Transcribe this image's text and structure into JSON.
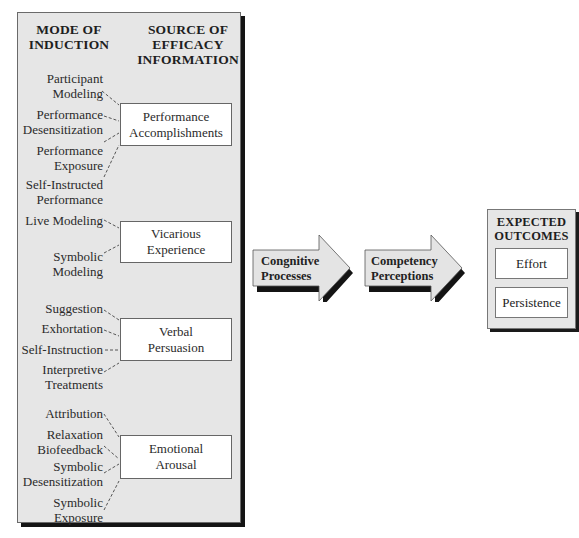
{
  "headers": {
    "mode_of_induction": [
      "MODE OF",
      "INDUCTION"
    ],
    "source_of_efficacy": [
      "SOURCE OF",
      "EFFICACY",
      "INFORMATION"
    ]
  },
  "sources": [
    {
      "label": [
        "Performance",
        "Accomplishments"
      ],
      "modes": [
        [
          "Participant",
          "Modeling"
        ],
        [
          "Performance",
          "Desensitization"
        ],
        [
          "Performance",
          "Exposure"
        ],
        [
          "Self-Instructed",
          "Performance"
        ]
      ]
    },
    {
      "label": [
        "Vicarious",
        "Experience"
      ],
      "modes": [
        [
          "Live Modeling"
        ],
        [
          "Symbolic",
          "Modeling"
        ]
      ]
    },
    {
      "label": [
        "Verbal",
        "Persuasion"
      ],
      "modes": [
        [
          "Suggestion"
        ],
        [
          "Exhortation"
        ],
        [
          "Self-Instruction"
        ],
        [
          "Interpretive",
          "Treatments"
        ]
      ]
    },
    {
      "label": [
        "Emotional",
        "Arousal"
      ],
      "modes": [
        [
          "Attribution"
        ],
        [
          "Relaxation",
          "Biofeedback"
        ],
        [
          "Symbolic",
          "Desensitization"
        ],
        [
          "Symbolic",
          "Exposure"
        ]
      ]
    }
  ],
  "arrows": [
    {
      "label": [
        "Congnitive",
        "Processes"
      ]
    },
    {
      "label": [
        "Competency",
        "Perceptions"
      ]
    }
  ],
  "outcomes": {
    "title": [
      "EXPECTED",
      "OUTCOMES"
    ],
    "items": [
      "Effort",
      "Persistence"
    ]
  },
  "colors": {
    "panel_fill": "#e6e6e6",
    "box_fill": "#ffffff",
    "shadow": "#141414",
    "arrow_fill": "#e4e4e4"
  }
}
